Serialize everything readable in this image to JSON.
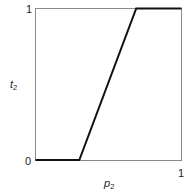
{
  "chart_data": {
    "type": "line",
    "title": "",
    "xlabel": "p2",
    "ylabel": "t2",
    "xlim": [
      0,
      1
    ],
    "ylim": [
      0,
      1
    ],
    "grid": false,
    "legend": null,
    "x_ticks": [
      "1"
    ],
    "y_ticks": [
      "0",
      "1"
    ],
    "series": [
      {
        "name": "t2(p2)",
        "x": [
          0,
          0.3,
          0.69,
          1
        ],
        "y": [
          0,
          0,
          1,
          1
        ]
      }
    ]
  },
  "labels": {
    "y_top": "1",
    "y_bottom": "0",
    "x_right": "1",
    "xlabel_main": "p",
    "xlabel_sub": "2",
    "ylabel_main": "t",
    "ylabel_sub": "2"
  },
  "colors": {
    "frame": "#8a8a8a",
    "line": "#111111"
  }
}
